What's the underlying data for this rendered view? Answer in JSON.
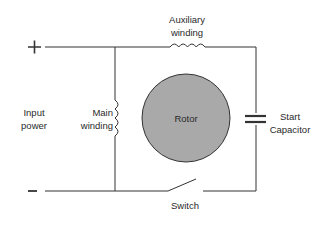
{
  "diagram": {
    "terminals": {
      "positive": "+",
      "negative": "–"
    },
    "labels": {
      "input_power": [
        "Input",
        "power"
      ],
      "main_winding": [
        "Main",
        "winding"
      ],
      "auxiliary_winding": [
        "Auxiliary",
        "winding"
      ],
      "rotor": "Rotor",
      "start_capacitor": [
        "Start",
        "Capacitor"
      ],
      "switch": "Switch"
    },
    "colors": {
      "line": "#333333",
      "rotor_fill": "#a9a9a9",
      "rotor_stroke": "#333333"
    }
  }
}
